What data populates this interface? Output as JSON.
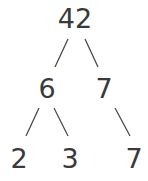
{
  "diagram": {
    "type": "factor-tree",
    "nodes": [
      {
        "id": "root",
        "label": "42"
      },
      {
        "id": "left",
        "label": "6"
      },
      {
        "id": "right",
        "label": "7"
      },
      {
        "id": "left-left",
        "label": "2"
      },
      {
        "id": "left-right",
        "label": "3"
      },
      {
        "id": "right-right",
        "label": "7"
      }
    ],
    "edges": [
      {
        "from": "root",
        "to": "left"
      },
      {
        "from": "root",
        "to": "right"
      },
      {
        "from": "left",
        "to": "left-left"
      },
      {
        "from": "left",
        "to": "left-right"
      },
      {
        "from": "right",
        "to": "right-right"
      }
    ]
  }
}
